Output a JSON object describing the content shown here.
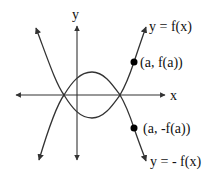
{
  "diagram": {
    "axes": {
      "x_label": "x",
      "y_label": "y"
    },
    "curves": [
      {
        "name": "f",
        "label": "y = f(x)"
      },
      {
        "name": "neg-f",
        "label": "y = - f(x)"
      }
    ],
    "points": [
      {
        "name": "point-a-fa",
        "label": "(a, f(a))"
      },
      {
        "name": "point-a-neg-fa",
        "label": "(a, -f(a))"
      }
    ],
    "colors": {
      "stroke": "#333333",
      "point": "#000000",
      "background": "#ffffff"
    }
  }
}
